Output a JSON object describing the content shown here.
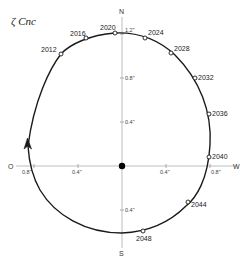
{
  "title": "ζ Cnc",
  "axes": {
    "north_label": "N",
    "south_label": "S",
    "east_label": "O",
    "west_label": "W",
    "north_ticks": [
      "0.4\"",
      "0.8\"",
      "1.2\""
    ],
    "south_ticks": [
      "0.4\""
    ],
    "east_ticks": [
      "0.4\"",
      "0.8\""
    ],
    "west_ticks": [
      "0.4\"",
      "0.8\""
    ]
  },
  "colors": {
    "orbit": "#1a1a1a",
    "axis": "#b0b0b0",
    "star": "#000000",
    "marker_fill": "#ffffff"
  },
  "orbit_points": [
    {
      "year": "2012",
      "x": 61,
      "y": 54,
      "lx": 41,
      "ly": 52
    },
    {
      "year": "2016",
      "x": 86,
      "y": 38,
      "lx": 70,
      "ly": 36
    },
    {
      "year": "2020",
      "x": 115,
      "y": 33,
      "lx": 100,
      "ly": 30
    },
    {
      "year": "2024",
      "x": 145,
      "y": 38,
      "lx": 148,
      "ly": 35
    },
    {
      "year": "2028",
      "x": 171,
      "y": 53,
      "lx": 174,
      "ly": 51
    },
    {
      "year": "2032",
      "x": 195,
      "y": 78,
      "lx": 198,
      "ly": 80
    },
    {
      "year": "2036",
      "x": 209,
      "y": 114,
      "lx": 212,
      "ly": 116
    },
    {
      "year": "2040",
      "x": 209,
      "y": 157,
      "lx": 212,
      "ly": 159
    },
    {
      "year": "2044",
      "x": 188,
      "y": 202,
      "lx": 191,
      "ly": 207
    },
    {
      "year": "2048",
      "x": 143,
      "y": 231,
      "lx": 136,
      "ly": 241
    }
  ]
}
